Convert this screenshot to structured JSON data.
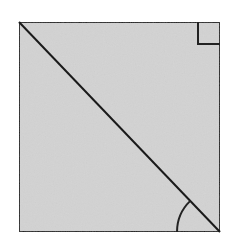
{
  "diagram": {
    "type": "geometry",
    "colors": {
      "background": "#ffffff",
      "fill": "#d3d3d3",
      "stroke": "#222222"
    },
    "square": {
      "x": 19,
      "y": 22,
      "width": 201,
      "height": 210
    },
    "diagonal": {
      "x1": 19,
      "y1": 22,
      "x2": 220,
      "y2": 232
    },
    "right_angle_marker": {
      "corner": "top-right",
      "size": 22
    },
    "angle_arc": {
      "corner": "bottom-right",
      "radius": 43
    },
    "labels": []
  }
}
